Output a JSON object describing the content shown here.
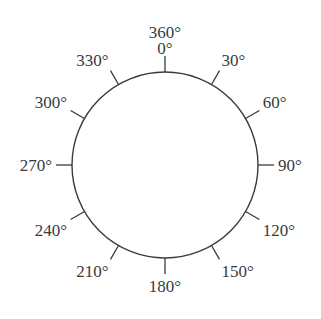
{
  "diagram": {
    "type": "angle-dial",
    "center": [
      165,
      165
    ],
    "radius": 93,
    "tick_length": 16,
    "stroke_color": "#3a3a3a",
    "text_color": "#3a3a3a",
    "top_extra_label": "360°",
    "labels": [
      {
        "angle": 0,
        "text": "0°"
      },
      {
        "angle": 30,
        "text": "30°"
      },
      {
        "angle": 60,
        "text": "60°"
      },
      {
        "angle": 90,
        "text": "90°"
      },
      {
        "angle": 120,
        "text": "120°"
      },
      {
        "angle": 150,
        "text": "150°"
      },
      {
        "angle": 180,
        "text": "180°"
      },
      {
        "angle": 210,
        "text": "210°"
      },
      {
        "angle": 240,
        "text": "240°"
      },
      {
        "angle": 270,
        "text": "270°"
      },
      {
        "angle": 300,
        "text": "300°"
      },
      {
        "angle": 330,
        "text": "330°"
      }
    ]
  }
}
